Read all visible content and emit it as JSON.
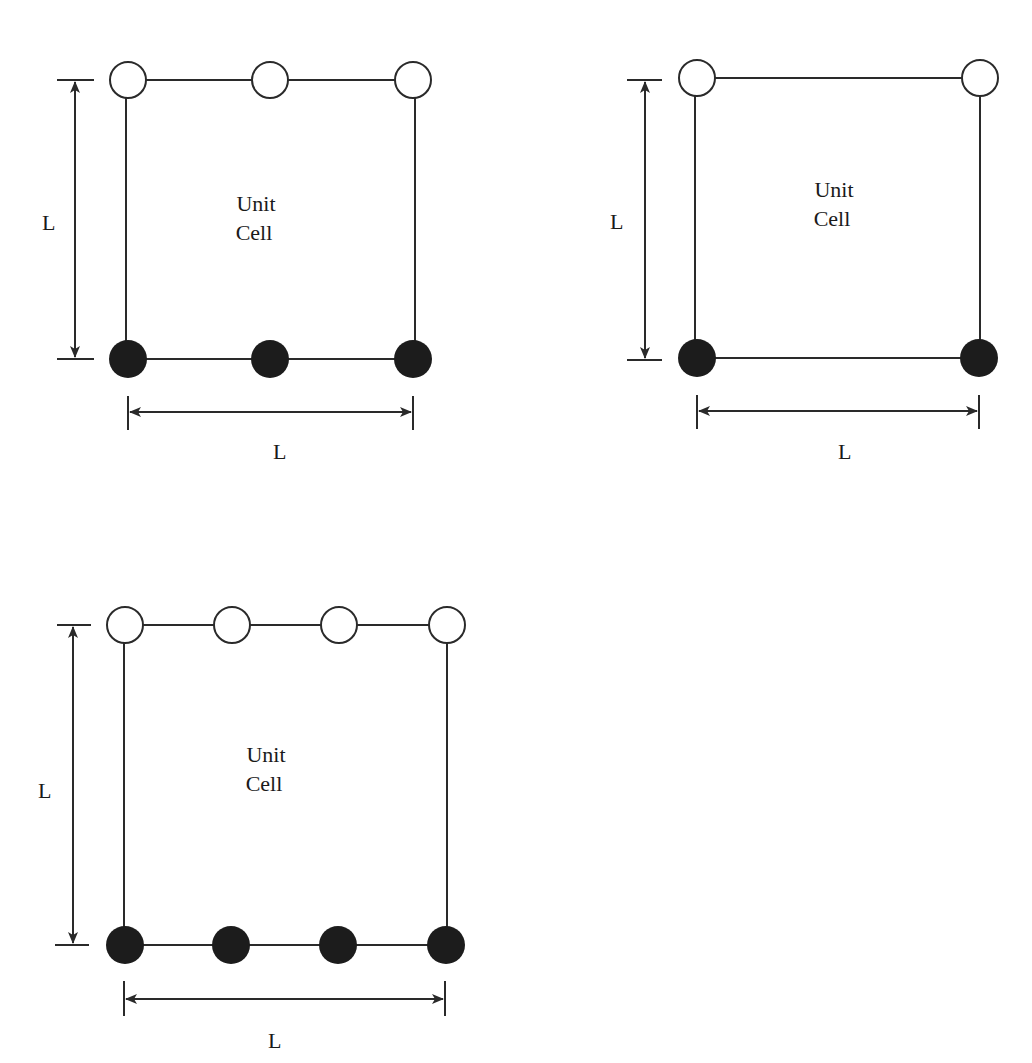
{
  "diagrams": [
    {
      "id": "cell-3-nodes",
      "cell_label_line1": "Unit",
      "cell_label_line2": "Cell",
      "height_label": "L",
      "width_label": "L",
      "nodes_per_edge": 3,
      "top_nodes": "open",
      "bottom_nodes": "filled"
    },
    {
      "id": "cell-2-nodes",
      "cell_label_line1": "Unit",
      "cell_label_line2": "Cell",
      "height_label": "L",
      "width_label": "L",
      "nodes_per_edge": 2,
      "top_nodes": "open",
      "bottom_nodes": "filled"
    },
    {
      "id": "cell-4-nodes",
      "cell_label_line1": "Unit",
      "cell_label_line2": "Cell",
      "height_label": "L",
      "width_label": "L",
      "nodes_per_edge": 4,
      "top_nodes": "open",
      "bottom_nodes": "filled"
    }
  ],
  "colors": {
    "line": "#2a2a2a",
    "filled_node": "#1c1c1c",
    "open_node_fill": "#ffffff",
    "background": "#ffffff"
  }
}
